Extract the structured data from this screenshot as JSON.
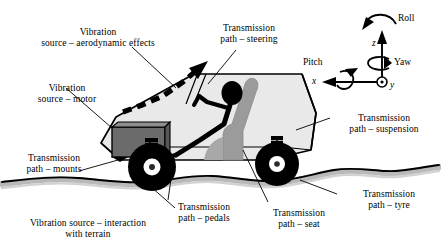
{
  "figure": {
    "colors": {
      "body_fill": "#e9e9e9",
      "body_stroke": "#000000",
      "motor_fill": "#6b6b6b",
      "seat_fill": "#9b9b9b",
      "tyre_fill": "#000000",
      "hub_fill": "#ffffff",
      "terrain_band": "#b8b8b8",
      "driver_fill": "#000000",
      "background": "#ffffff"
    }
  },
  "labels": {
    "aero": "Vibration\nsource – aerodynamic effects",
    "motor": "Vibration\nsource – motor",
    "steering": "Transmission\npath – steering",
    "suspension": "Transmission\npath – suspension",
    "mounts": "Transmission\npath – mounts",
    "tyre": "Transmission\npath – tyre",
    "pedals": "Transmission\npath – pedals",
    "seat": "Transmission\npath – seat",
    "terrain": "Vibration source – interaction\nwith terrain"
  },
  "axes": {
    "roll": "Roll",
    "pitch": "Pitch",
    "yaw": "Yaw",
    "x": "x",
    "y": "y",
    "z": "z"
  }
}
